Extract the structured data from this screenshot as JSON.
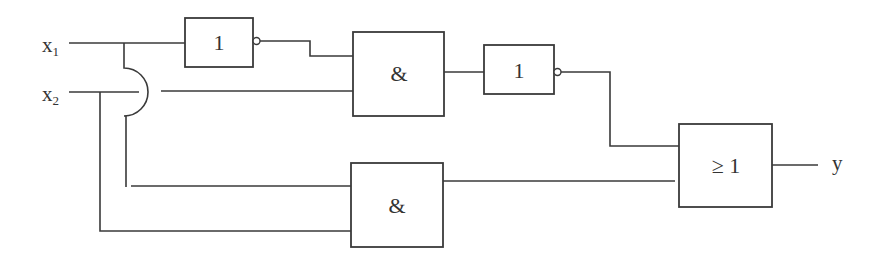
{
  "diagram": {
    "type": "logic-circuit",
    "inputs": [
      {
        "name": "x",
        "subscript": "1"
      },
      {
        "name": "x",
        "subscript": "2"
      }
    ],
    "output": {
      "name": "y"
    },
    "gates": [
      {
        "id": "not1",
        "symbol": "1",
        "type": "NOT",
        "inputs": [
          "x1"
        ]
      },
      {
        "id": "and1",
        "symbol": "&",
        "type": "AND",
        "inputs": [
          "not1",
          "x2"
        ]
      },
      {
        "id": "not2",
        "symbol": "1",
        "type": "NOT",
        "inputs": [
          "and1"
        ]
      },
      {
        "id": "and2",
        "symbol": "&",
        "type": "AND",
        "inputs": [
          "x1",
          "x2"
        ]
      },
      {
        "id": "or1",
        "symbol": "≥ 1",
        "type": "OR",
        "inputs": [
          "not2",
          "and2"
        ]
      }
    ]
  },
  "colors": {
    "line": "#3a3a3a",
    "background": "#ffffff"
  }
}
